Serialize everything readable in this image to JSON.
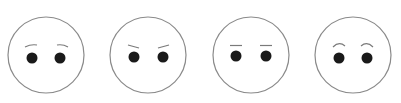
{
  "faces": [
    {
      "id": "face-1",
      "expression": "worried",
      "cx": 46,
      "cy": 55,
      "r": 38,
      "brow_style": "slanted-down-outward"
    },
    {
      "id": "face-2",
      "expression": "angry",
      "cx": 148,
      "cy": 55,
      "r": 38,
      "brow_style": "slanted-down-inward"
    },
    {
      "id": "face-3",
      "expression": "neutral",
      "cx": 251,
      "cy": 55,
      "r": 38,
      "brow_style": "flat"
    },
    {
      "id": "face-4",
      "expression": "surprised",
      "cx": 353,
      "cy": 55,
      "r": 38,
      "brow_style": "arched"
    }
  ],
  "colors": {
    "background": "#ffffff",
    "outline": "#8a8a8a",
    "eye": "#1a1a1a",
    "brow": "#7a7a7a"
  }
}
